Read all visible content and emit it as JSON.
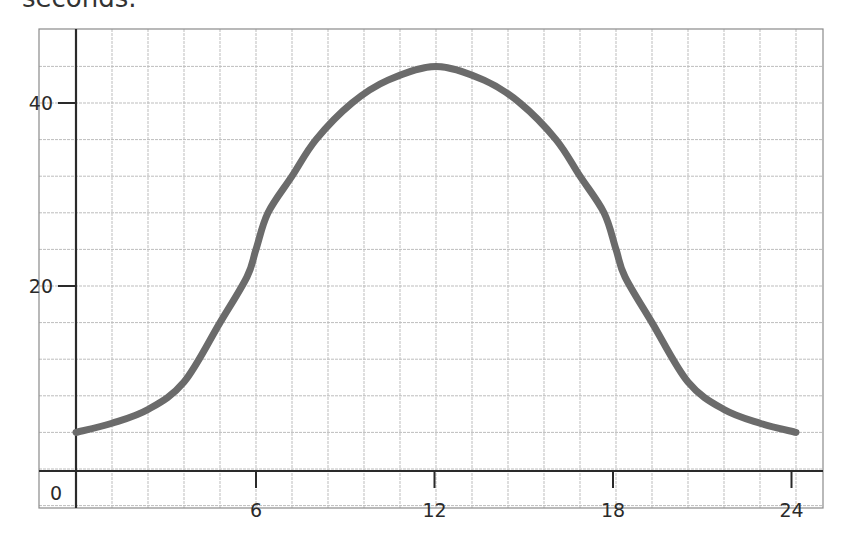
{
  "caption_fragment": "seconds.",
  "chart_data": {
    "type": "line",
    "title": "",
    "xlabel": "",
    "ylabel": "",
    "x_ticks": [
      6,
      12,
      18,
      24
    ],
    "y_ticks": [
      20,
      40
    ],
    "origin_label": "0",
    "xlim": [
      -1.25,
      24.9
    ],
    "ylim": [
      -4,
      48
    ],
    "grid": true,
    "grid_x_step": 1.2,
    "grid_y_step": 4,
    "legend": null,
    "series": [
      {
        "name": "curve",
        "color": "#6b6b6b",
        "x": [
          0,
          1.2,
          2.4,
          3.6,
          4.8,
          5.7,
          6,
          6.4,
          7.2,
          8,
          9.2,
          10.4,
          12,
          13.6,
          14.8,
          16,
          16.8,
          17.6,
          18,
          18.3,
          19.2,
          20.4,
          21.6,
          22.8,
          24
        ],
        "y": [
          4,
          5,
          6.5,
          9.5,
          16,
          21,
          24,
          28,
          32,
          36,
          40,
          42.5,
          44,
          42.5,
          40,
          36,
          32,
          28,
          24,
          21,
          16,
          9.5,
          6.5,
          5,
          4
        ]
      }
    ]
  },
  "colors": {
    "axis": "#2a2a2a",
    "grid": "#bdbdbd",
    "curve": "#6b6b6b"
  }
}
